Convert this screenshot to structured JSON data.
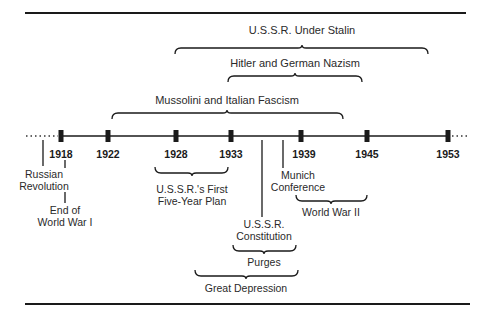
{
  "timeline": {
    "years": [
      {
        "label": "1918",
        "x": 61
      },
      {
        "label": "1922",
        "x": 108
      },
      {
        "label": "1928",
        "x": 176
      },
      {
        "label": "1933",
        "x": 231
      },
      {
        "label": "1939",
        "x": 301
      },
      {
        "label": "1945",
        "x": 367
      },
      {
        "label": "1953",
        "x": 448
      }
    ]
  },
  "spans_above": [
    {
      "label": "U.S.S.R. Under Stalin",
      "from": 175,
      "to": 428
    },
    {
      "label": "Hitler and German Nazism",
      "from": 228,
      "to": 362
    },
    {
      "label": "Mussolini and Italian Fascism",
      "from": 112,
      "to": 343
    }
  ],
  "events_below": {
    "russian_revolution": [
      "Russian",
      "Revolution"
    ],
    "end_ww1": [
      "End of",
      "World War I"
    ],
    "five_year_plan": [
      "U.S.S.R.'s First",
      "Five-Year Plan"
    ],
    "constitution": [
      "U.S.S.R.",
      "Constitution"
    ],
    "munich": [
      "Munich",
      "Conference"
    ],
    "ww2": "World War II",
    "purges": "Purges",
    "great_depression": "Great Depression"
  },
  "colors": {
    "ink": "#1a1a1a"
  }
}
